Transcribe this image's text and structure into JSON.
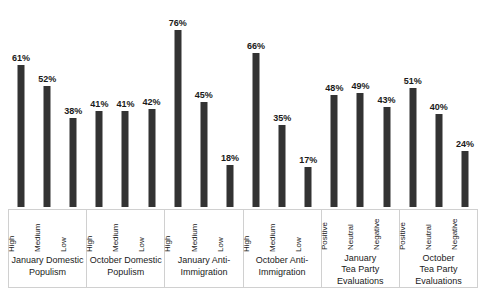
{
  "chart_data": {
    "type": "bar",
    "title": "",
    "subtitle": "",
    "xlabel": "",
    "ylabel": "",
    "ylim": [
      0,
      80
    ],
    "grid": false,
    "legend": "none",
    "value_suffix": "%",
    "bar_color": "#333333",
    "categories": [
      "January Domestic Populism",
      "October Domestic Populism",
      "January Anti-Immigration",
      "October Anti-Immigration",
      "January Tea Party Evaluations",
      "October Tea Party Evaluations"
    ],
    "groups": [
      {
        "title_lines": [
          "January Domestic",
          "Populism"
        ],
        "ticks": [
          "High",
          "Medium",
          "Low"
        ],
        "values": [
          61,
          52,
          38
        ],
        "labels": [
          "61%",
          "52%",
          "38%"
        ]
      },
      {
        "title_lines": [
          "October Domestic",
          "Populism"
        ],
        "ticks": [
          "High",
          "Medium",
          "Low"
        ],
        "values": [
          41,
          41,
          42
        ],
        "labels": [
          "41%",
          "41%",
          "42%"
        ]
      },
      {
        "title_lines": [
          "January Anti-",
          "Immigration"
        ],
        "ticks": [
          "High",
          "Medium",
          "Low"
        ],
        "values": [
          76,
          45,
          18
        ],
        "labels": [
          "76%",
          "45%",
          "18%"
        ]
      },
      {
        "title_lines": [
          "October Anti-",
          "Immigration"
        ],
        "ticks": [
          "High",
          "Medium",
          "Low"
        ],
        "values": [
          66,
          35,
          17
        ],
        "labels": [
          "66%",
          "35%",
          "17%"
        ]
      },
      {
        "title_lines": [
          "January",
          "Tea Party",
          "Evaluations"
        ],
        "ticks": [
          "Positive",
          "Neutral",
          "Negative"
        ],
        "values": [
          48,
          49,
          43
        ],
        "labels": [
          "48%",
          "49%",
          "43%"
        ]
      },
      {
        "title_lines": [
          "October",
          "Tea Party",
          "Evaluations"
        ],
        "ticks": [
          "Positive",
          "Neutral",
          "Negative"
        ],
        "values": [
          51,
          40,
          24
        ],
        "labels": [
          "51%",
          "40%",
          "24%"
        ]
      }
    ]
  }
}
